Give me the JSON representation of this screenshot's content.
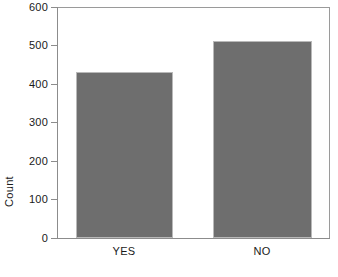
{
  "chart_data": {
    "type": "bar",
    "title": "",
    "subtitle": "",
    "xlabel": "",
    "ylabel": "Count",
    "categories": [
      "YES",
      "NO"
    ],
    "values": [
      430,
      512
    ],
    "series": [
      {
        "name": "Count",
        "values": [
          430,
          512
        ]
      }
    ],
    "ylim": [
      0,
      600
    ],
    "yticks": [
      0,
      100,
      200,
      300,
      400,
      500,
      600
    ],
    "ytick_labels": [
      "0",
      "100",
      "200",
      "300",
      "400",
      "500",
      "600"
    ],
    "grid": false,
    "legend": false,
    "legend_position": "none",
    "bar_color": "#6e6e6e",
    "bar_edge_color": "#b9b9b9",
    "axis_color": "#8c8c8c",
    "text_color": "#1a1a1a",
    "background_color": "#ffffff"
  },
  "axes": {
    "y_title": "Count",
    "tick_labels": [
      "600",
      "500",
      "400",
      "300",
      "200",
      "100",
      "0"
    ],
    "category_labels": [
      "YES",
      "NO"
    ]
  }
}
